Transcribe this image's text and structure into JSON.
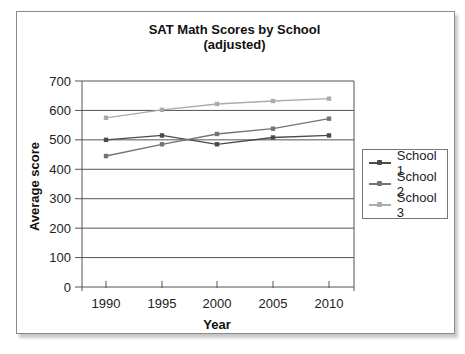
{
  "chart_data": {
    "type": "line",
    "title": "SAT Math Scores by School",
    "subtitle": "(adjusted)",
    "xlabel": "Year",
    "ylabel": "Average score",
    "x": [
      1990,
      1995,
      2000,
      2005,
      2010
    ],
    "categories": [
      "1990",
      "1995",
      "2000",
      "2005",
      "2010"
    ],
    "yticks": [
      0,
      100,
      200,
      300,
      400,
      500,
      600,
      700
    ],
    "ylim": [
      0,
      700
    ],
    "grid": true,
    "legend_position": "right",
    "series": [
      {
        "name": "School 1",
        "color": "#4a4a4a",
        "values": [
          500,
          515,
          485,
          508,
          515
        ]
      },
      {
        "name": "School 2",
        "color": "#737373",
        "values": [
          445,
          485,
          520,
          538,
          572
        ]
      },
      {
        "name": "School 3",
        "color": "#ababab",
        "values": [
          575,
          602,
          622,
          632,
          640
        ]
      }
    ]
  },
  "title_line1": "SAT Math Scores by School",
  "title_line2": "(adjusted)",
  "xlabel": "Year",
  "ylabel": "Average score",
  "legend": [
    {
      "label": "School 1",
      "color": "#4a4a4a"
    },
    {
      "label": "School 2",
      "color": "#737373"
    },
    {
      "label": "School 3",
      "color": "#ababab"
    }
  ]
}
